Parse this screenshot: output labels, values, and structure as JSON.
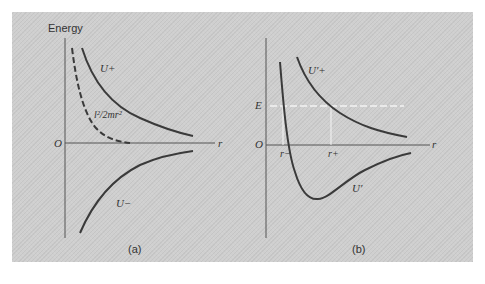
{
  "figure": {
    "panels": [
      {
        "id": "a",
        "caption": "(a)",
        "y_axis_label": "Energy",
        "origin_label": "O",
        "x_axis_label": "r",
        "curves": [
          {
            "label": "U+",
            "style": "solid",
            "shape": "decreasing positive repulsive"
          },
          {
            "label": "l²/2mr²",
            "style": "dashed",
            "shape": "centrifugal term, decreasing to zero"
          },
          {
            "label": "U−",
            "style": "solid",
            "shape": "negative attractive, approaching zero"
          }
        ]
      },
      {
        "id": "b",
        "caption": "(b)",
        "energy_level_label": "E",
        "origin_label": "O",
        "x_axis_label": "r",
        "turning_points": [
          "r−",
          "r+"
        ],
        "curves": [
          {
            "label": "U′+",
            "style": "solid",
            "shape": "decreasing positive"
          },
          {
            "label": "U′",
            "style": "solid",
            "shape": "potential well with minimum below zero"
          }
        ],
        "energy_line_style": "dashed white"
      }
    ],
    "colors": {
      "background": "#cfcfcf",
      "curve": "#3a3a3a",
      "axis": "#555555",
      "energy_line": "#f4f4f4"
    }
  }
}
